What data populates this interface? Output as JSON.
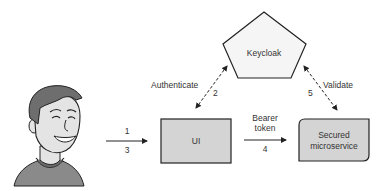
{
  "diagram": {
    "nodes": {
      "user": {
        "label": "User",
        "icon": "person-avatar-icon"
      },
      "keycloak": {
        "label": "Keycloak",
        "shape": "pentagon"
      },
      "ui": {
        "label": "UI",
        "shape": "rectangle"
      },
      "microservice": {
        "label_line1": "Secured",
        "label_line2": "microservice",
        "shape": "rounded-rectangle"
      }
    },
    "edges": {
      "user_to_ui": {
        "step_top": "1",
        "step_bottom": "3",
        "style": "solid"
      },
      "ui_keycloak": {
        "label": "Authenticate",
        "step": "2",
        "style": "dashed"
      },
      "ui_to_microservice": {
        "label_line1": "Bearer",
        "label_line2": "token",
        "step": "4",
        "style": "solid"
      },
      "microservice_keycloak": {
        "label": "Validate",
        "step": "5",
        "style": "dashed"
      }
    },
    "colors": {
      "box_fill": "#d4d4d4",
      "pentagon_fill": "#f5f5f5",
      "stroke": "#222222",
      "text": "#333333",
      "skin": "#e4e4e4",
      "hair": "#6e6e6e",
      "shirt": "#8a8a8a"
    }
  }
}
